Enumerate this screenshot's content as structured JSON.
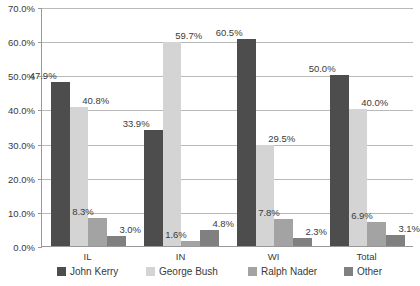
{
  "chart_data": {
    "type": "bar",
    "title": "",
    "subtitle": "",
    "xlabel": "",
    "ylabel": "",
    "ylim": [
      0,
      70
    ],
    "ytick_step": 10,
    "grid": true,
    "grid_axis": "y",
    "legend_position": "bottom",
    "value_labels": true,
    "value_label_format": "percent-1dp",
    "categories": [
      "IL",
      "IN",
      "WI",
      "Total"
    ],
    "ytick_labels": [
      "0.0%",
      "10.0%",
      "20.0%",
      "30.0%",
      "40.0%",
      "50.0%",
      "60.0%",
      "70.0%"
    ],
    "ytick_values": [
      0,
      10,
      20,
      30,
      40,
      50,
      60,
      70
    ],
    "series": [
      {
        "name": "John Kerry",
        "color": "#4d4d4d",
        "values": [
          47.9,
          33.9,
          60.5,
          50.0
        ],
        "labels": [
          "47.9%",
          "33.9%",
          "60.5%",
          "50.0%"
        ]
      },
      {
        "name": "George Bush",
        "color": "#d4d4d4",
        "values": [
          40.8,
          59.7,
          29.5,
          40.0
        ],
        "labels": [
          "40.8%",
          "59.7%",
          "29.5%",
          "40.0%"
        ]
      },
      {
        "name": "Ralph Nader",
        "color": "#a3a3a3",
        "values": [
          8.3,
          1.6,
          7.8,
          6.9
        ],
        "labels": [
          "8.3%",
          "1.6%",
          "7.8%",
          "6.9%"
        ]
      },
      {
        "name": "Other",
        "color": "#808080",
        "values": [
          3.0,
          4.8,
          2.3,
          3.1
        ],
        "labels": [
          "3.0%",
          "4.8%",
          "2.3%",
          "3.1%"
        ]
      }
    ]
  },
  "legend": {
    "items": [
      {
        "label": "John Kerry",
        "color": "#4d4d4d"
      },
      {
        "label": "George Bush",
        "color": "#d4d4d4"
      },
      {
        "label": "Ralph Nader",
        "color": "#a3a3a3"
      },
      {
        "label": "Other",
        "color": "#808080"
      }
    ]
  }
}
